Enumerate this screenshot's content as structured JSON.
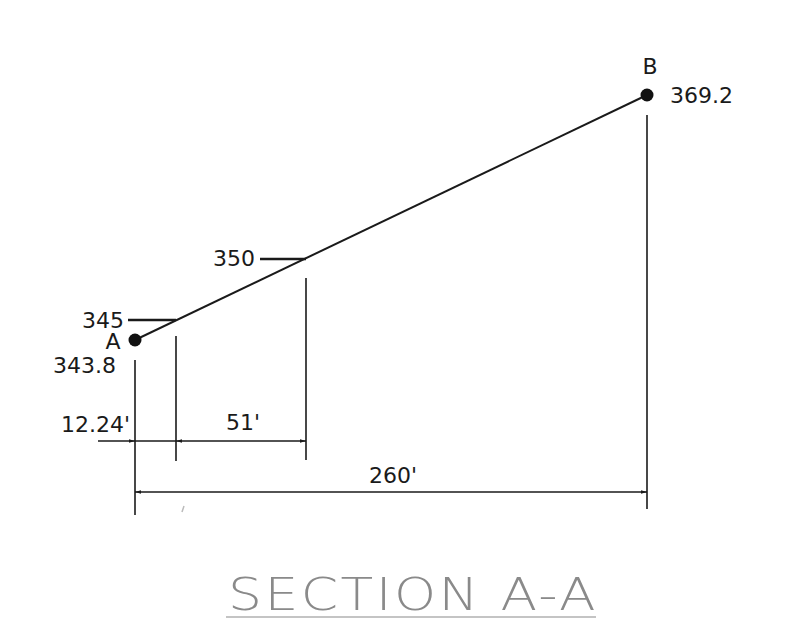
{
  "diagram": {
    "title": "SECTION A-A",
    "points": {
      "A": {
        "label": "A",
        "elevation": "343.8"
      },
      "B": {
        "label": "B",
        "elevation": "369.2"
      }
    },
    "contours": [
      {
        "label": "345"
      },
      {
        "label": "350"
      }
    ],
    "dimensions": {
      "offset_to_345": "12.24'",
      "345_to_350": "51'",
      "total_length": "260'"
    },
    "colors": {
      "line": "#1a1a1a",
      "title": "#8a8a8a",
      "background": "#ffffff"
    }
  }
}
